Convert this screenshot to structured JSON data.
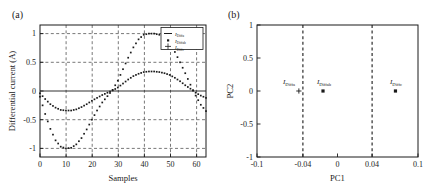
{
  "figure": {
    "panel_a_tag": "(a)",
    "panel_b_tag": "(b)"
  },
  "panel_a": {
    "xlabel": "Samples",
    "ylabel": "Differential current (A)",
    "xticks": [
      "0",
      "10",
      "20",
      "30",
      "40",
      "50",
      "60"
    ],
    "yticks": [
      "1",
      "0.5",
      "0",
      "-0.5",
      "-1"
    ],
    "legend": [
      {
        "symbol": "line",
        "main": "I",
        "sub": "Diffa"
      },
      {
        "symbol": "square",
        "main": "I",
        "sub": "Diffab"
      },
      {
        "symbol": "plus",
        "main": "I",
        "sub": "Diffc"
      }
    ]
  },
  "panel_b": {
    "xlabel": "PC1",
    "ylabel": "PC2",
    "xticks": [
      "-0.1",
      "-0.04",
      "0",
      "0.04",
      "0.1"
    ],
    "yticks": [
      "1",
      "0.5",
      "0",
      "-0.5",
      "-1"
    ],
    "point_labels": [
      {
        "main": "I",
        "sub": "Diffa"
      },
      {
        "main": "I",
        "sub": "Diffab"
      },
      {
        "main": "I",
        "sub": "Diffc"
      }
    ]
  },
  "chart_data": [
    {
      "type": "line",
      "panel": "(a)",
      "title": "",
      "xlabel": "Samples",
      "ylabel": "Differential current (A)",
      "xlim": [
        0,
        64
      ],
      "ylim": [
        -1.15,
        1.15
      ],
      "xticks": [
        0,
        10,
        20,
        30,
        40,
        50,
        60
      ],
      "yticks": [
        -1,
        -0.5,
        0,
        0.5,
        1
      ],
      "grid": true,
      "legend_position": "upper-right",
      "series": [
        {
          "name": "I_Diffa",
          "marker": "line",
          "comment": "flat zero trace spanning all samples",
          "x": [
            0,
            8,
            16,
            24,
            32,
            40,
            48,
            56,
            64
          ],
          "values": [
            0,
            0,
            0,
            0,
            0,
            0,
            0,
            0,
            0
          ]
        },
        {
          "name": "I_Diffab",
          "marker": "square",
          "comment": "large sinusoid amplitude 1.0, minimum near sample 11, zero crossing near 28, maximum near 44",
          "x": [
            0,
            2,
            4,
            6,
            8,
            10,
            12,
            14,
            16,
            18,
            20,
            22,
            24,
            26,
            28,
            30,
            32,
            34,
            36,
            38,
            40,
            42,
            44,
            46,
            48,
            50,
            52,
            54,
            56,
            58,
            60,
            62,
            64
          ],
          "values": [
            -0.1,
            -0.4,
            -0.66,
            -0.86,
            -0.97,
            -1.0,
            -0.99,
            -0.93,
            -0.82,
            -0.67,
            -0.5,
            -0.34,
            -0.2,
            -0.09,
            0.02,
            0.18,
            0.38,
            0.58,
            0.76,
            0.9,
            0.98,
            1.0,
            1.0,
            0.98,
            0.93,
            0.83,
            0.68,
            0.5,
            0.31,
            0.11,
            -0.08,
            -0.24,
            -0.35
          ]
        },
        {
          "name": "I_Diffc",
          "marker": "plus",
          "comment": "small sinusoid amplitude ~0.33, same phase as I_Diffab",
          "x": [
            0,
            2,
            4,
            6,
            8,
            10,
            12,
            14,
            16,
            18,
            20,
            22,
            24,
            26,
            28,
            30,
            32,
            34,
            36,
            38,
            40,
            42,
            44,
            46,
            48,
            50,
            52,
            54,
            56,
            58,
            60,
            62,
            64
          ],
          "values": [
            -0.04,
            -0.14,
            -0.23,
            -0.29,
            -0.33,
            -0.34,
            -0.34,
            -0.32,
            -0.28,
            -0.23,
            -0.17,
            -0.12,
            -0.07,
            -0.03,
            0.01,
            0.06,
            0.13,
            0.2,
            0.26,
            0.3,
            0.33,
            0.34,
            0.34,
            0.33,
            0.31,
            0.28,
            0.23,
            0.17,
            0.1,
            0.04,
            -0.03,
            -0.08,
            -0.12
          ]
        }
      ]
    },
    {
      "type": "scatter",
      "panel": "(b)",
      "title": "",
      "xlabel": "PC1",
      "ylabel": "PC2",
      "xlim": [
        -0.1,
        0.1
      ],
      "ylim": [
        -1,
        1
      ],
      "xticks": [
        -0.1,
        -0.04,
        0,
        0.04,
        0.1
      ],
      "yticks": [
        -1,
        -0.5,
        0,
        0.5,
        1
      ],
      "grid": false,
      "vertical_reference_lines": [
        -0.04,
        0.04
      ],
      "points": [
        {
          "label": "I_Diffa",
          "marker": "plus",
          "x": -0.048,
          "y": 0
        },
        {
          "label": "I_Diffab",
          "marker": "square",
          "x": -0.018,
          "y": 0
        },
        {
          "label": "I_Diffc",
          "marker": "square",
          "x": 0.072,
          "y": 0
        }
      ]
    }
  ]
}
